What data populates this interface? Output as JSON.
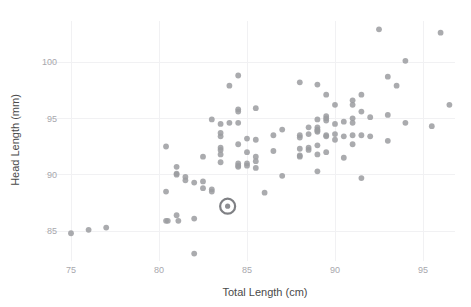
{
  "chart_data": {
    "type": "scatter",
    "title": "",
    "subtitle": "",
    "xlabel": "Total Length (cm)",
    "ylabel": "Head Length (mm)",
    "xlim": [
      73.5,
      96.8
    ],
    "ylim": [
      82.3,
      103.6
    ],
    "xticks": [
      75,
      80,
      85,
      90,
      95
    ],
    "xticklabels": [
      "75",
      "80",
      "85",
      "90",
      "95"
    ],
    "yticks": [
      85,
      90,
      95,
      100
    ],
    "yticklabels": [
      "85",
      "90",
      "95",
      "100"
    ],
    "grid": true,
    "legend": null,
    "point_color": "#9b9ca0",
    "point_radius": 2.9,
    "highlight": {
      "x": 83.9,
      "y": 87.2,
      "ring_color": "#7f8084",
      "ring_radius": 7.5,
      "core_radius": 2.6
    },
    "series": [
      {
        "name": "possums",
        "points": [
          [
            75.0,
            84.8
          ],
          [
            76.0,
            85.1
          ],
          [
            77.0,
            85.3
          ],
          [
            80.4,
            92.5
          ],
          [
            80.4,
            88.5
          ],
          [
            80.4,
            85.9
          ],
          [
            80.5,
            85.9
          ],
          [
            81.0,
            90.7
          ],
          [
            81.0,
            90.1
          ],
          [
            81.0,
            90.0
          ],
          [
            81.0,
            86.4
          ],
          [
            81.1,
            85.9
          ],
          [
            81.5,
            89.8
          ],
          [
            81.5,
            89.5
          ],
          [
            82.0,
            89.3
          ],
          [
            82.0,
            86.1
          ],
          [
            82.0,
            83.0
          ],
          [
            82.5,
            91.6
          ],
          [
            82.5,
            89.4
          ],
          [
            82.5,
            88.8
          ],
          [
            83.0,
            94.9
          ],
          [
            83.0,
            88.7
          ],
          [
            83.0,
            88.5
          ],
          [
            83.5,
            94.5
          ],
          [
            83.5,
            93.7
          ],
          [
            83.5,
            93.4
          ],
          [
            83.5,
            92.4
          ],
          [
            83.5,
            92.2
          ],
          [
            83.5,
            91.8
          ],
          [
            83.5,
            91.1
          ],
          [
            84.0,
            97.9
          ],
          [
            84.0,
            94.6
          ],
          [
            84.5,
            98.8
          ],
          [
            84.5,
            95.8
          ],
          [
            84.5,
            95.6
          ],
          [
            84.5,
            94.6
          ],
          [
            84.5,
            92.7
          ],
          [
            84.5,
            91.0
          ],
          [
            84.5,
            90.8
          ],
          [
            84.5,
            90.7
          ],
          [
            85.0,
            93.2
          ],
          [
            85.0,
            92.0
          ],
          [
            85.0,
            91.0
          ],
          [
            85.0,
            90.8
          ],
          [
            85.5,
            95.9
          ],
          [
            85.5,
            93.1
          ],
          [
            85.5,
            91.6
          ],
          [
            85.5,
            91.2
          ],
          [
            85.5,
            90.6
          ],
          [
            86.0,
            88.4
          ],
          [
            86.5,
            93.5
          ],
          [
            86.5,
            92.1
          ],
          [
            87.0,
            94.0
          ],
          [
            87.0,
            89.9
          ],
          [
            88.0,
            98.2
          ],
          [
            88.0,
            93.5
          ],
          [
            88.0,
            93.3
          ],
          [
            88.0,
            92.3
          ],
          [
            88.0,
            91.7
          ],
          [
            88.0,
            91.6
          ],
          [
            88.5,
            94.2
          ],
          [
            88.5,
            93.6
          ],
          [
            88.5,
            92.4
          ],
          [
            88.5,
            92.2
          ],
          [
            89.0,
            98.0
          ],
          [
            89.0,
            94.9
          ],
          [
            89.0,
            94.2
          ],
          [
            89.0,
            94.0
          ],
          [
            89.0,
            93.9
          ],
          [
            89.0,
            93.8
          ],
          [
            89.0,
            92.6
          ],
          [
            89.0,
            91.8
          ],
          [
            89.0,
            90.3
          ],
          [
            89.5,
            97.1
          ],
          [
            89.5,
            95.2
          ],
          [
            89.5,
            95.0
          ],
          [
            89.5,
            94.8
          ],
          [
            89.5,
            93.5
          ],
          [
            89.5,
            93.4
          ],
          [
            89.5,
            92.0
          ],
          [
            90.0,
            96.2
          ],
          [
            90.0,
            94.5
          ],
          [
            90.0,
            93.6
          ],
          [
            90.0,
            93.1
          ],
          [
            90.5,
            94.7
          ],
          [
            90.5,
            93.4
          ],
          [
            90.5,
            91.5
          ],
          [
            91.0,
            96.6
          ],
          [
            91.0,
            96.2
          ],
          [
            91.0,
            95.0
          ],
          [
            91.0,
            94.6
          ],
          [
            91.0,
            93.5
          ],
          [
            91.0,
            92.7
          ],
          [
            91.5,
            97.1
          ],
          [
            91.5,
            95.6
          ],
          [
            91.5,
            93.5
          ],
          [
            91.5,
            89.7
          ],
          [
            92.0,
            95.1
          ],
          [
            92.0,
            93.4
          ],
          [
            92.5,
            102.9
          ],
          [
            93.0,
            98.7
          ],
          [
            93.0,
            95.3
          ],
          [
            93.0,
            93.0
          ],
          [
            93.5,
            97.9
          ],
          [
            94.0,
            100.1
          ],
          [
            94.0,
            94.6
          ],
          [
            95.5,
            94.3
          ],
          [
            96.0,
            102.6
          ],
          [
            96.5,
            96.2
          ]
        ]
      }
    ]
  },
  "axes": {
    "x_title": "Total Length (cm)",
    "y_title": "Head Length (mm)"
  }
}
